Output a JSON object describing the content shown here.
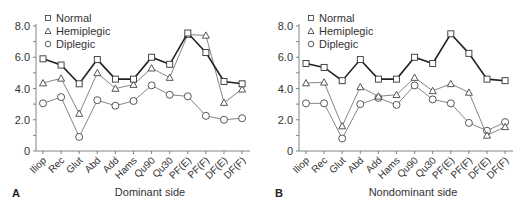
{
  "chart_data": [
    {
      "type": "line",
      "panel": "A",
      "title": "",
      "xlabel": "Dominant side",
      "ylabel": "",
      "ylim": [
        0,
        8.0
      ],
      "yticks": [
        "0",
        "2.0",
        "4.0",
        "6.0",
        "8.0"
      ],
      "grid": false,
      "legend_position": "top-left",
      "categories": [
        "Iliop",
        "Rec",
        "Glut",
        "Abd",
        "Add",
        "Hams",
        "Qu90",
        "Qu30",
        "PF(E)",
        "PF(F)",
        "DF(E)",
        "DF(F)"
      ],
      "series": [
        {
          "name": "Normal",
          "marker": "square",
          "values": [
            5.9,
            5.5,
            4.3,
            5.85,
            4.6,
            4.6,
            6.0,
            5.55,
            7.55,
            6.3,
            4.45,
            4.3
          ]
        },
        {
          "name": "Hemiplegic",
          "marker": "triangle",
          "values": [
            4.35,
            4.65,
            2.4,
            5.0,
            4.0,
            4.25,
            5.3,
            4.7,
            7.45,
            7.4,
            3.1,
            3.95
          ]
        },
        {
          "name": "Diplegic",
          "marker": "circle",
          "values": [
            3.05,
            3.45,
            0.9,
            3.25,
            2.9,
            3.2,
            4.2,
            3.6,
            3.5,
            2.25,
            2.0,
            2.1
          ]
        }
      ]
    },
    {
      "type": "line",
      "panel": "B",
      "title": "",
      "xlabel": "Nondominant side",
      "ylabel": "",
      "ylim": [
        0,
        8.0
      ],
      "yticks": [
        "0",
        "2.0",
        "4.0",
        "6.0",
        "8.0"
      ],
      "grid": false,
      "legend_position": "top-left",
      "categories": [
        "Iliop",
        "Rec",
        "Glut",
        "Abd",
        "Add",
        "Hams",
        "Qu90",
        "Qu30",
        "PF(E)",
        "PF(F)",
        "DF(E)",
        "DF(F)"
      ],
      "series": [
        {
          "name": "Normal",
          "marker": "square",
          "values": [
            5.6,
            5.35,
            4.5,
            5.85,
            4.6,
            4.6,
            6.0,
            5.6,
            7.5,
            6.25,
            4.6,
            4.5
          ]
        },
        {
          "name": "Hemiplegic",
          "marker": "triangle",
          "values": [
            4.35,
            4.4,
            1.6,
            4.1,
            3.5,
            3.6,
            4.7,
            3.85,
            4.3,
            3.75,
            1.0,
            1.55
          ]
        },
        {
          "name": "Diplegic",
          "marker": "circle",
          "values": [
            3.05,
            3.05,
            0.8,
            3.0,
            3.4,
            2.95,
            4.2,
            3.3,
            3.05,
            1.8,
            1.3,
            1.85
          ]
        }
      ]
    }
  ],
  "panels": [
    {
      "letter": "A",
      "xlabel": "Dominant side"
    },
    {
      "letter": "B",
      "xlabel": "Nondominant side"
    }
  ],
  "legend": [
    "Normal",
    "Hemiplegic",
    "Diplegic"
  ]
}
